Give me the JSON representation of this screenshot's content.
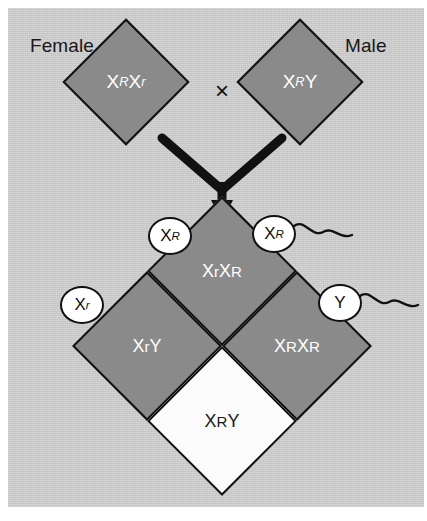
{
  "figure": {
    "type": "punnett-square",
    "background_color": "#c3c3c3",
    "shaded_color": "#8a8a8a",
    "unaffected_fill": "#ffffff",
    "outline_color": "#111111"
  },
  "parents": {
    "female": {
      "label": "Female",
      "genotype_x1": "X",
      "genotype_sup1": "R",
      "genotype_x2": "X",
      "genotype_sup2": "r"
    },
    "male": {
      "label": "Male",
      "genotype_x1": "X",
      "genotype_sup1": "R",
      "genotype_x2": "Y",
      "genotype_sup2": ""
    },
    "cross_symbol": "×"
  },
  "gametes": [
    {
      "name": "egg-xr-dominant",
      "base": "X",
      "sup": "R",
      "kind": "egg",
      "has_tail": false
    },
    {
      "name": "sperm-xr-dominant",
      "base": "X",
      "sup": "R",
      "kind": "sperm",
      "has_tail": true
    },
    {
      "name": "egg-xr-recessive",
      "base": "X",
      "sup": "r",
      "kind": "egg",
      "has_tail": false
    },
    {
      "name": "sperm-y",
      "base": "Y",
      "sup": "",
      "kind": "sperm",
      "has_tail": true
    }
  ],
  "offspring": {
    "top": {
      "x1": "X",
      "sup1": "R",
      "x2": "X",
      "sup2": "R",
      "fill": "shaded"
    },
    "left": {
      "x1": "X",
      "sup1": "r",
      "x2": "X",
      "sup2": "R",
      "fill": "shaded"
    },
    "right": {
      "x1": "X",
      "sup1": "R",
      "x2": "Y",
      "sup2": "",
      "fill": "shaded"
    },
    "bottom": {
      "x1": "X",
      "sup1": "r",
      "x2": "Y",
      "sup2": "",
      "fill": "white"
    }
  }
}
